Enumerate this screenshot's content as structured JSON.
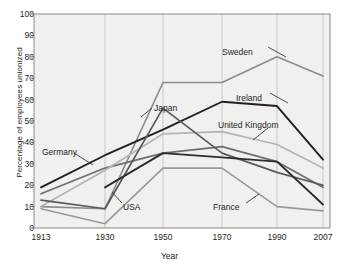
{
  "chart_data": {
    "type": "line",
    "title": "",
    "xlabel": "Year",
    "ylabel": "Percentage of employees unionized",
    "categories": [
      "1913",
      "1930",
      "1950",
      "1970",
      "1990",
      "2007"
    ],
    "ylim": [
      0,
      100
    ],
    "yticks": [
      0,
      10,
      20,
      30,
      40,
      50,
      60,
      70,
      80,
      90,
      100
    ],
    "grid": "vertical",
    "legend": "inline-annotations",
    "series": [
      {
        "name": "Sweden",
        "values": [
          10,
          9,
          68,
          68,
          80,
          71
        ],
        "color": "#8d8d8d"
      },
      {
        "name": "Ireland",
        "values": [
          19,
          34,
          46,
          59,
          57,
          32
        ],
        "color": "#231f20"
      },
      {
        "name": "Germany",
        "values": [
          16,
          28,
          35,
          38,
          31,
          19
        ],
        "color": "#6e6e6e"
      },
      {
        "name": "United Kingdom",
        "values": [
          10,
          27,
          44,
          45,
          39,
          28
        ],
        "color": "#b4b4b4"
      },
      {
        "name": "Japan",
        "values": [
          13,
          9,
          56,
          35,
          26,
          20
        ],
        "color": "#595959"
      },
      {
        "name": "USA",
        "values": [
          null,
          19,
          35,
          33,
          31,
          11
        ],
        "color": "#2f2b2c"
      },
      {
        "name": "France",
        "values": [
          9,
          2,
          28,
          28,
          10,
          8
        ],
        "color": "#9a9a9a"
      }
    ],
    "annotations": [
      {
        "label": "Sweden",
        "x": 222,
        "y": 48
      },
      {
        "label": "Ireland",
        "x": 236,
        "y": 94
      },
      {
        "label": "United Kingdom",
        "x": 218,
        "y": 121
      },
      {
        "label": "Japan",
        "x": 154,
        "y": 104
      },
      {
        "label": "Germany",
        "x": 42,
        "y": 148
      },
      {
        "label": "USA",
        "x": 123,
        "y": 203
      },
      {
        "label": "France",
        "x": 213,
        "y": 203
      }
    ]
  },
  "axes": {
    "x_labels": [
      "1913",
      "1930",
      "1950",
      "1970",
      "1990",
      "2007"
    ],
    "y_labels": [
      "100",
      "90",
      "80",
      "70",
      "60",
      "50",
      "40",
      "30",
      "20",
      "10",
      "0"
    ],
    "x_title": "Year",
    "y_title": "Percentage of employees unionized"
  }
}
